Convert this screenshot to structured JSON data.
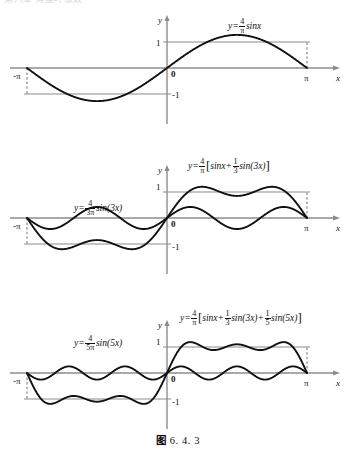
{
  "page": {
    "top_partial_text": "第六章 傅里叶级数",
    "caption": "图 6.4.3",
    "caption_prefix": "图",
    "caption_number": "6. 4. 3",
    "background_color": "#ffffff",
    "curve_color": "#111111",
    "reference_line_color": "#8c8c8c",
    "axis_color": "#8c8c8c",
    "dashed_line_color": "#6e6e6e"
  },
  "axis_labels": {
    "y": "y",
    "x": "x",
    "origin": "0",
    "one": "1",
    "minus_one": "-1",
    "pi": "π",
    "minus_pi": "-π"
  },
  "panels": [
    {
      "id": "panel-1",
      "harmonics": [
        1
      ],
      "sum_label": {
        "lhs": "y=",
        "coef_num": "4",
        "coef_den": "π",
        "body": "sinx"
      },
      "component_label": null
    },
    {
      "id": "panel-2",
      "harmonics": [
        1,
        3
      ],
      "sum_label": {
        "lhs": "y=",
        "coef_num": "4",
        "coef_den": "π",
        "open": "[",
        "term1": "sinx+",
        "f2_num": "1",
        "f2_den": "3",
        "term2": "sin(3x)",
        "close": "]"
      },
      "component_label": {
        "lhs": "y=",
        "coef_num": "4",
        "coef_den": "3π",
        "body": "sin(3x)"
      }
    },
    {
      "id": "panel-3",
      "harmonics": [
        1,
        3,
        5
      ],
      "sum_label": {
        "lhs": "y=",
        "coef_num": "4",
        "coef_den": "π",
        "open": "[",
        "term1": "sinx+",
        "f2_num": "1",
        "f2_den": "3",
        "term2": "sin(3x)+",
        "f3_num": "1",
        "f3_den": "5",
        "term3": "sin(5x)",
        "close": "]"
      },
      "component_label": {
        "lhs": "y=",
        "coef_num": "4",
        "coef_den": "5π",
        "body": "sin(5x)"
      }
    }
  ],
  "chart_data": [
    {
      "type": "line",
      "title": "y=(4/π) sinx",
      "xlabel": "x",
      "ylabel": "y",
      "xlim": [
        -3.14159,
        3.14159
      ],
      "xticks": [
        -3.14159,
        0,
        3.14159
      ],
      "xticklabels": [
        "-π",
        "0",
        "π"
      ],
      "ylim": [
        -1.45,
        1.45
      ],
      "yticks": [
        -1,
        1
      ],
      "yticklabels": [
        "-1",
        "1"
      ],
      "grid": false,
      "reference_lines": [
        {
          "type": "hline",
          "y": 1,
          "color": "#8c8c8c"
        },
        {
          "type": "hline",
          "y": -1,
          "color": "#8c8c8c"
        },
        {
          "type": "vline-dashed",
          "x": -3.14159,
          "from": 0,
          "to": -1
        },
        {
          "type": "vline-dashed",
          "x": 3.14159,
          "from": 0,
          "to": 1
        }
      ],
      "series": [
        {
          "name": "y=(4/π) sinx",
          "formula": "(4/pi)*sin(x)",
          "terms": [
            {
              "n": 1,
              "amplitude": 1.2732
            }
          ],
          "peak_value": 1.2732,
          "color": "#111111"
        }
      ]
    },
    {
      "type": "line",
      "title": "y=(4/π)[sinx+(1/3)sin(3x)]",
      "xlabel": "x",
      "ylabel": "y",
      "xlim": [
        -3.14159,
        3.14159
      ],
      "xticks": [
        -3.14159,
        0,
        3.14159
      ],
      "xticklabels": [
        "-π",
        "0",
        "π"
      ],
      "ylim": [
        -1.45,
        1.45
      ],
      "yticks": [
        -1,
        1
      ],
      "yticklabels": [
        "-1",
        "1"
      ],
      "grid": false,
      "reference_lines": [
        {
          "type": "hline",
          "y": 1,
          "color": "#8c8c8c"
        },
        {
          "type": "hline",
          "y": -1,
          "color": "#8c8c8c"
        },
        {
          "type": "vline-dashed",
          "x": -3.14159,
          "from": 0,
          "to": -1
        },
        {
          "type": "vline-dashed",
          "x": 3.14159,
          "from": 0,
          "to": 1
        }
      ],
      "series": [
        {
          "name": "y=(4/3π) sin(3x)",
          "formula": "(4/(3*pi))*sin(3*x)",
          "terms": [
            {
              "n": 3,
              "amplitude": 0.4244
            }
          ],
          "peak_value": 0.4244,
          "color": "#111111"
        },
        {
          "name": "y=(4/π)[sinx+(1/3)sin(3x)]",
          "formula": "(4/pi)*(sin(x)+sin(3*x)/3)",
          "terms": [
            {
              "n": 1,
              "amplitude": 1.2732
            },
            {
              "n": 3,
              "amplitude": 0.4244
            }
          ],
          "peak_value": 1.1937,
          "color": "#111111"
        }
      ]
    },
    {
      "type": "line",
      "title": "y=(4/π)[sinx+(1/3)sin(3x)+(1/5)sin(5x)]",
      "xlabel": "x",
      "ylabel": "y",
      "xlim": [
        -3.14159,
        3.14159
      ],
      "xticks": [
        -3.14159,
        0,
        3.14159
      ],
      "xticklabels": [
        "-π",
        "0",
        "π"
      ],
      "ylim": [
        -1.45,
        1.45
      ],
      "yticks": [
        -1,
        1
      ],
      "yticklabels": [
        "-1",
        "1"
      ],
      "grid": false,
      "reference_lines": [
        {
          "type": "hline",
          "y": 1,
          "color": "#8c8c8c"
        },
        {
          "type": "hline",
          "y": -1,
          "color": "#8c8c8c"
        },
        {
          "type": "vline-dashed",
          "x": -3.14159,
          "from": 0,
          "to": -1
        },
        {
          "type": "vline-dashed",
          "x": 3.14159,
          "from": 0,
          "to": 1
        }
      ],
      "series": [
        {
          "name": "y=(4/5π) sin(5x)",
          "formula": "(4/(5*pi))*sin(5*x)",
          "terms": [
            {
              "n": 5,
              "amplitude": 0.2546
            }
          ],
          "peak_value": 0.2546,
          "color": "#111111"
        },
        {
          "name": "y=(4/π)[sinx+(1/3)sin(3x)+(1/5)sin(5x)]",
          "formula": "(4/pi)*(sin(x)+sin(3*x)/3+sin(5*x)/5)",
          "terms": [
            {
              "n": 1,
              "amplitude": 1.2732
            },
            {
              "n": 3,
              "amplitude": 0.4244
            },
            {
              "n": 5,
              "amplitude": 0.2546
            }
          ],
          "peak_value": 1.2005,
          "color": "#111111"
        }
      ]
    }
  ]
}
